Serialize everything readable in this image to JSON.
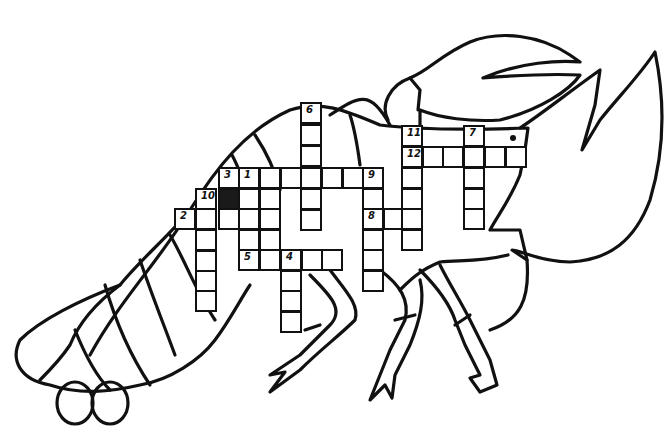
{
  "colors": {
    "ink": "#111111",
    "paper": "#ffffff",
    "blocked": "#1a1a1a"
  },
  "cell_size": 21,
  "clue_numbers": [
    {
      "n": "1",
      "x": 238,
      "y": 167
    },
    {
      "n": "2",
      "x": 174,
      "y": 208
    },
    {
      "n": "3",
      "x": 218,
      "y": 167
    },
    {
      "n": "4",
      "x": 280,
      "y": 249
    },
    {
      "n": "5",
      "x": 238,
      "y": 249
    },
    {
      "n": "6",
      "x": 300,
      "y": 102
    },
    {
      "n": "7",
      "x": 463,
      "y": 125
    },
    {
      "n": "8",
      "x": 362,
      "y": 208
    },
    {
      "n": "9",
      "x": 362,
      "y": 167
    },
    {
      "n": "10",
      "x": 195,
      "y": 188
    },
    {
      "n": "11",
      "x": 401,
      "y": 125
    },
    {
      "n": "12",
      "x": 401,
      "y": 146
    }
  ],
  "cells": [
    [
      218,
      167
    ],
    [
      238,
      167
    ],
    [
      259,
      167
    ],
    [
      280,
      167
    ],
    [
      300,
      167
    ],
    [
      321,
      167
    ],
    [
      342,
      167
    ],
    [
      362,
      167
    ],
    [
      300,
      102
    ],
    [
      300,
      124
    ],
    [
      300,
      145
    ],
    [
      300,
      188
    ],
    [
      300,
      209
    ],
    [
      195,
      188
    ],
    [
      218,
      188,
      "black"
    ],
    [
      238,
      188
    ],
    [
      259,
      188
    ],
    [
      174,
      208
    ],
    [
      195,
      208
    ],
    [
      218,
      208
    ],
    [
      238,
      208
    ],
    [
      259,
      208
    ],
    [
      195,
      229
    ],
    [
      195,
      250
    ],
    [
      195,
      270
    ],
    [
      195,
      290
    ],
    [
      238,
      229
    ],
    [
      259,
      229
    ],
    [
      238,
      249
    ],
    [
      259,
      249
    ],
    [
      280,
      249
    ],
    [
      301,
      249
    ],
    [
      321,
      249
    ],
    [
      280,
      270
    ],
    [
      280,
      290
    ],
    [
      280,
      311
    ],
    [
      362,
      188
    ],
    [
      362,
      208
    ],
    [
      362,
      229
    ],
    [
      362,
      249
    ],
    [
      362,
      270
    ],
    [
      383,
      208
    ],
    [
      401,
      208
    ],
    [
      401,
      125
    ],
    [
      401,
      146
    ],
    [
      401,
      167
    ],
    [
      401,
      188
    ],
    [
      401,
      229
    ],
    [
      422,
      146
    ],
    [
      442,
      146
    ],
    [
      463,
      146
    ],
    [
      484,
      146
    ],
    [
      505,
      146
    ],
    [
      463,
      125
    ],
    [
      463,
      167
    ],
    [
      463,
      188
    ],
    [
      463,
      208
    ]
  ]
}
